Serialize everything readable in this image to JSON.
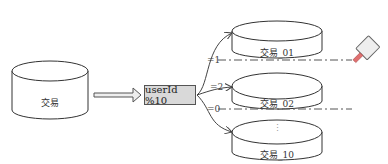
{
  "source_db": {
    "label": "交易"
  },
  "hash_box": {
    "label": "userId %10"
  },
  "branches": [
    {
      "condition": "=1",
      "shard_label": "交易_01"
    },
    {
      "condition": "=2",
      "shard_label": "交易_02"
    },
    {
      "condition": "=0",
      "shard_label": "交易_10",
      "ellipsis": "⋮"
    }
  ],
  "icons": {
    "cleaver": "cleaver-icon"
  }
}
